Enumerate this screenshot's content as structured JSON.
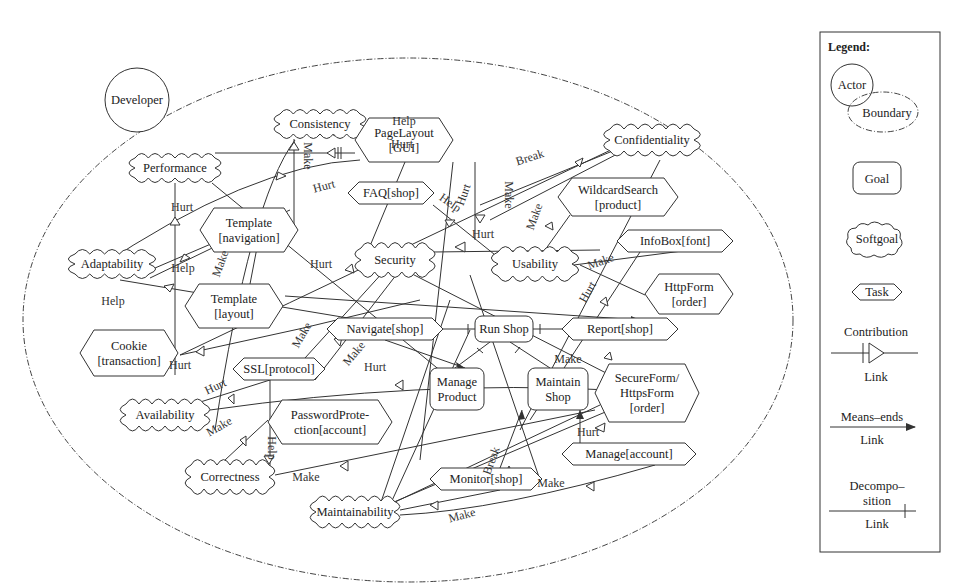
{
  "actor": {
    "name": "Developer"
  },
  "softgoals": [
    {
      "id": "consistency",
      "label": "Consistency",
      "x": 320,
      "y": 124,
      "w": 92,
      "h": 30
    },
    {
      "id": "performance",
      "label": "Performance",
      "x": 175,
      "y": 168,
      "w": 92,
      "h": 30
    },
    {
      "id": "confidentiality",
      "label": "Confidentiality",
      "x": 652,
      "y": 140,
      "w": 96,
      "h": 32
    },
    {
      "id": "adaptability",
      "label": "Adaptability",
      "x": 112,
      "y": 264,
      "w": 86,
      "h": 30
    },
    {
      "id": "security",
      "label": "Security",
      "x": 395,
      "y": 260,
      "w": 80,
      "h": 34
    },
    {
      "id": "usability",
      "label": "Usability",
      "x": 535,
      "y": 264,
      "w": 86,
      "h": 34
    },
    {
      "id": "availability",
      "label": "Availability",
      "x": 165,
      "y": 415,
      "w": 90,
      "h": 32
    },
    {
      "id": "correctness",
      "label": "Correctness",
      "x": 230,
      "y": 477,
      "w": 90,
      "h": 34
    },
    {
      "id": "maintainability",
      "label": "Maintainability",
      "x": 355,
      "y": 512,
      "w": 90,
      "h": 32
    }
  ],
  "tasks": [
    {
      "id": "pagelayout",
      "lines": [
        "PageLayout",
        "[GUI]"
      ],
      "x": 355,
      "y": 118,
      "w": 98,
      "h": 44
    },
    {
      "id": "tmplnav",
      "lines": [
        "Template",
        "[navigation]"
      ],
      "x": 200,
      "y": 208,
      "w": 98,
      "h": 44
    },
    {
      "id": "faq",
      "lines": [
        "FAQ[shop]"
      ],
      "x": 348,
      "y": 182,
      "w": 86,
      "h": 22
    },
    {
      "id": "wildcard",
      "lines": [
        "WildcardSearch",
        "[product]"
      ],
      "x": 558,
      "y": 178,
      "w": 120,
      "h": 38
    },
    {
      "id": "infobox",
      "lines": [
        "InfoBox[font]"
      ],
      "x": 617,
      "y": 230,
      "w": 116,
      "h": 22
    },
    {
      "id": "tmpllayout",
      "lines": [
        "Template",
        "[layout]"
      ],
      "x": 185,
      "y": 284,
      "w": 98,
      "h": 44
    },
    {
      "id": "httpform",
      "lines": [
        "HttpForm",
        "[order]"
      ],
      "x": 645,
      "y": 274,
      "w": 88,
      "h": 40
    },
    {
      "id": "cookie",
      "lines": [
        "Cookie",
        "[transaction]"
      ],
      "x": 80,
      "y": 330,
      "w": 98,
      "h": 46
    },
    {
      "id": "navigate",
      "lines": [
        "Navigate[shop]"
      ],
      "x": 327,
      "y": 318,
      "w": 116,
      "h": 22
    },
    {
      "id": "report",
      "lines": [
        "Report[shop]"
      ],
      "x": 562,
      "y": 318,
      "w": 116,
      "h": 22
    },
    {
      "id": "ssl",
      "lines": [
        "SSL[protocol]"
      ],
      "x": 233,
      "y": 358,
      "w": 92,
      "h": 22
    },
    {
      "id": "secureform",
      "lines": [
        "SecureForm/",
        "HttpsForm",
        "[order]"
      ],
      "x": 595,
      "y": 364,
      "w": 104,
      "h": 58
    },
    {
      "id": "pwdprot",
      "lines": [
        "PasswordProte-",
        "ction[account]"
      ],
      "x": 268,
      "y": 400,
      "w": 124,
      "h": 44
    },
    {
      "id": "monitor",
      "lines": [
        "Monitor[shop]"
      ],
      "x": 430,
      "y": 468,
      "w": 112,
      "h": 22
    },
    {
      "id": "manageacct",
      "lines": [
        "Manage[account]"
      ],
      "x": 562,
      "y": 443,
      "w": 134,
      "h": 22
    }
  ],
  "goals": [
    {
      "id": "runshop",
      "lines": [
        "Run Shop"
      ],
      "x": 475,
      "y": 316,
      "w": 58,
      "h": 26
    },
    {
      "id": "manageproduct",
      "lines": [
        "Manage",
        "Product"
      ],
      "x": 430,
      "y": 368,
      "w": 54,
      "h": 42
    },
    {
      "id": "maintainshop",
      "lines": [
        "Maintain",
        "Shop"
      ],
      "x": 528,
      "y": 368,
      "w": 60,
      "h": 42
    }
  ],
  "contribution_labels": [
    {
      "text": "Help",
      "x": 404,
      "y": 125
    },
    {
      "text": "Hurt",
      "x": 402,
      "y": 148
    },
    {
      "text": "Hurt",
      "x": 182,
      "y": 211
    },
    {
      "text": "Make",
      "x": 304,
      "y": 156,
      "rot": 90
    },
    {
      "text": "Hurt",
      "x": 325,
      "y": 190,
      "rot": -15
    },
    {
      "text": "Break",
      "x": 531,
      "y": 161,
      "rot": -18
    },
    {
      "text": "Hurt",
      "x": 467,
      "y": 196,
      "rot": -70
    },
    {
      "text": "Make",
      "x": 505,
      "y": 195,
      "rot": 90
    },
    {
      "text": "Help",
      "x": 448,
      "y": 206,
      "rot": 35
    },
    {
      "text": "Make",
      "x": 538,
      "y": 218,
      "rot": -70
    },
    {
      "text": "Hurt",
      "x": 483,
      "y": 238
    },
    {
      "text": "Help",
      "x": 183,
      "y": 272
    },
    {
      "text": "Make",
      "x": 224,
      "y": 265,
      "rot": -70
    },
    {
      "text": "Hurt",
      "x": 321,
      "y": 268
    },
    {
      "text": "Help",
      "x": 113,
      "y": 305
    },
    {
      "text": "Make",
      "x": 602,
      "y": 265,
      "rot": -20
    },
    {
      "text": "Hurt",
      "x": 591,
      "y": 294,
      "rot": -60
    },
    {
      "text": "Make",
      "x": 305,
      "y": 337,
      "rot": -60
    },
    {
      "text": "Hurt",
      "x": 180,
      "y": 369
    },
    {
      "text": "Make",
      "x": 357,
      "y": 356,
      "rot": -50
    },
    {
      "text": "Hurt",
      "x": 375,
      "y": 371
    },
    {
      "text": "Make",
      "x": 568,
      "y": 363
    },
    {
      "text": "Hurt",
      "x": 217,
      "y": 390,
      "rot": -25
    },
    {
      "text": "Make",
      "x": 221,
      "y": 430,
      "rot": -30
    },
    {
      "text": "Help",
      "x": 268,
      "y": 448,
      "rot": 90
    },
    {
      "text": "Make",
      "x": 306,
      "y": 481
    },
    {
      "text": "Hurt",
      "x": 588,
      "y": 436
    },
    {
      "text": "Break",
      "x": 495,
      "y": 462,
      "rot": -70
    },
    {
      "text": "Make",
      "x": 551,
      "y": 487
    },
    {
      "text": "Make",
      "x": 463,
      "y": 519,
      "rot": -15
    }
  ],
  "legend": {
    "title": "Legend:",
    "actor": "Actor",
    "boundary": "Boundary",
    "goal": "Goal",
    "softgoal": "Softgoal",
    "task": "Task",
    "contribution": [
      "Contribution",
      "Link"
    ],
    "means_ends": [
      "Means–ends",
      "Link"
    ],
    "decomposition": [
      "Decompo–",
      "sition",
      "Link"
    ]
  }
}
